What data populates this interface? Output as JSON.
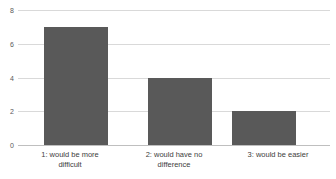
{
  "chart_data": {
    "type": "bar",
    "title": "",
    "subtitle": "",
    "xlabel": "",
    "ylabel": "",
    "categories": [
      "1:  would be more\ndifficult",
      "2: would have no\ndifference",
      "3: would be easier"
    ],
    "values": [
      7,
      4,
      2
    ],
    "ylim": [
      0,
      8
    ],
    "yticks": [
      0,
      2,
      4,
      6,
      8
    ],
    "ytick_labels": [
      "0",
      "2",
      "4",
      "6",
      "8"
    ],
    "grid": true,
    "grid_axis": "y",
    "legend": false,
    "legend_position": "none",
    "bar_color": "#595959",
    "gridline_color": "#d9d9d9",
    "axis_color": "#bfbfbf",
    "background_color": "#ffffff"
  },
  "axis": {
    "y": {
      "tick_0": "0",
      "tick_1": "2",
      "tick_2": "4",
      "tick_3": "6",
      "tick_4": "8"
    }
  },
  "bars": [
    {
      "label": "1:  would be more\ndifficult",
      "value": 7
    },
    {
      "label": "2: would have no\ndifference",
      "value": 4
    },
    {
      "label": "3: would be easier",
      "value": 2
    }
  ]
}
